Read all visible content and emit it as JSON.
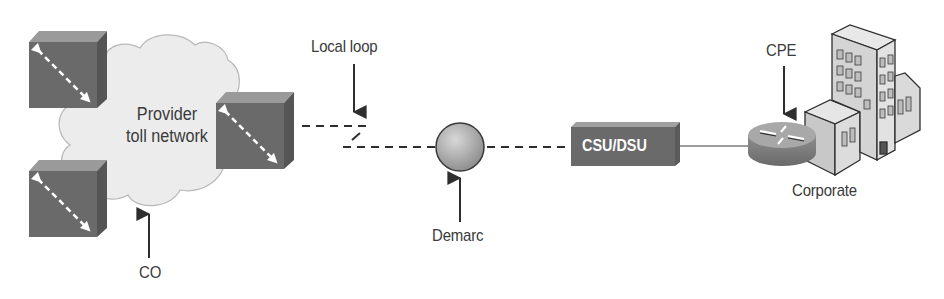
{
  "diagram": {
    "cloud": {
      "label_line1": "Provider",
      "label_line2": "toll network"
    },
    "labels": {
      "local_loop": "Local loop",
      "co": "CO",
      "demarc": "Demarc",
      "csu_dsu": "CSU/DSU",
      "cpe": "CPE",
      "corporate": "Corporate"
    },
    "nodes": [
      {
        "id": "switch-top-left",
        "type": "switch"
      },
      {
        "id": "switch-bottom-left",
        "type": "switch"
      },
      {
        "id": "switch-right",
        "type": "switch"
      },
      {
        "id": "demarc-point",
        "type": "demarc"
      },
      {
        "id": "csu-dsu",
        "type": "csu-dsu"
      },
      {
        "id": "cpe-router",
        "type": "router"
      },
      {
        "id": "corporate-building",
        "type": "building"
      }
    ],
    "edges": [
      {
        "from": "switch-right",
        "to": "demarc-point",
        "style": "dashed",
        "label": "Local loop"
      },
      {
        "from": "demarc-point",
        "to": "csu-dsu",
        "style": "dashed"
      },
      {
        "from": "csu-dsu",
        "to": "cpe-router",
        "style": "solid"
      }
    ],
    "colors": {
      "device_front": "#6a6a6a",
      "device_top": "#9a9a9a",
      "device_side": "#555555",
      "cloud_fill": "#ececec",
      "line": "#2e2e2e",
      "text": "#3a3a3a"
    }
  }
}
